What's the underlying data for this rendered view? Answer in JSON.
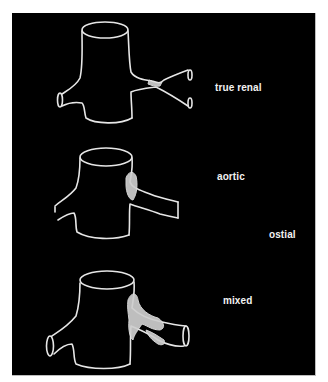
{
  "figure": {
    "background": "#000000",
    "line_color": "#e6e6e6",
    "panels": [
      {
        "id": "true-renal",
        "label": "true renal"
      },
      {
        "id": "aortic",
        "label": "aortic"
      },
      {
        "id": "ostial",
        "label": "ostial"
      },
      {
        "id": "mixed",
        "label": "mixed"
      }
    ]
  }
}
